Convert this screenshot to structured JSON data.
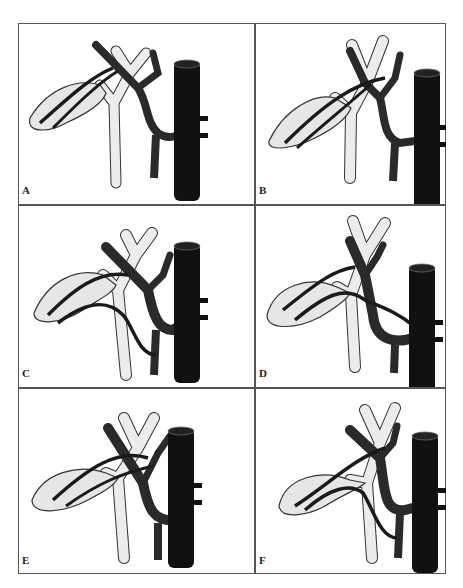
{
  "figure": {
    "panels": [
      {
        "id": "A",
        "label": "A"
      },
      {
        "id": "B",
        "label": "B"
      },
      {
        "id": "C",
        "label": "C"
      },
      {
        "id": "D",
        "label": "D"
      },
      {
        "id": "E",
        "label": "E"
      },
      {
        "id": "F",
        "label": "F"
      }
    ],
    "colors": {
      "frame": "#555555",
      "vessel_dark": "#2a2a2a",
      "vein_black": "#111111",
      "duct_light": "#ececec",
      "gallbladder": "#e6e6e6",
      "outline": "#333333"
    }
  }
}
